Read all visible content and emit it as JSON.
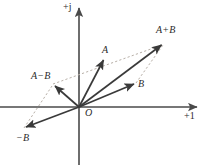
{
  "figure": {
    "width": 202,
    "height": 165,
    "background_color": "#ffffff",
    "axis_color": "#4a4a4a",
    "vector_color": "#3a3a3a",
    "dashed_color": "#b8b0a8",
    "text_color": "#2b2b2b"
  },
  "axes": {
    "origin": {
      "x": 79,
      "y": 107,
      "label": "O"
    },
    "horizontal": {
      "label": "+1",
      "label_x": 184,
      "label_y": 111,
      "x_start": 0,
      "x_end": 199,
      "y": 107
    },
    "vertical": {
      "label": "+j",
      "label_x": 63,
      "label_y": 2,
      "x": 79,
      "y_start": 165,
      "y_end": 5
    }
  },
  "vectors": [
    {
      "name": "A",
      "label": "A",
      "from_x": 79,
      "from_y": 107,
      "to_x": 104,
      "to_y": 58,
      "label_x": 102,
      "label_y": 45,
      "style": "solid"
    },
    {
      "name": "B",
      "label": "B",
      "from_x": 79,
      "from_y": 107,
      "to_x": 136,
      "to_y": 83,
      "label_x": 138,
      "label_y": 79,
      "style": "solid"
    },
    {
      "name": "A+B",
      "label": "A+B",
      "from_x": 79,
      "from_y": 107,
      "to_x": 164,
      "to_y": 43,
      "label_x": 156,
      "label_y": 25,
      "style": "solid"
    },
    {
      "name": "A-B",
      "label": "A−B",
      "from_x": 79,
      "from_y": 107,
      "to_x": 53,
      "to_y": 84,
      "label_x": 31,
      "label_y": 71,
      "style": "solid"
    },
    {
      "name": "-B",
      "label": "−B",
      "from_x": 79,
      "from_y": 107,
      "to_x": 24,
      "to_y": 128,
      "label_x": 16,
      "label_y": 133,
      "style": "solid"
    }
  ],
  "construction_lines": [
    {
      "name": "a-to-apb",
      "from_x": 53,
      "from_y": 84,
      "to_x": 164,
      "to_y": 43,
      "style": "dashed"
    },
    {
      "name": "b-to-apb",
      "from_x": 136,
      "from_y": 83,
      "to_x": 164,
      "to_y": 43,
      "style": "dashed"
    },
    {
      "name": "negb-to-amb",
      "from_x": 24,
      "from_y": 128,
      "to_x": 53,
      "to_y": 84,
      "style": "dashed"
    }
  ]
}
